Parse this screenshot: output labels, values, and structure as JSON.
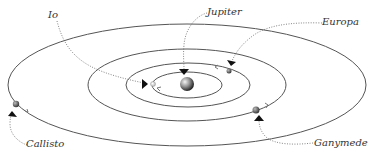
{
  "diagram": {
    "center": {
      "name": "Jupiter",
      "x": 187,
      "y": 84,
      "r": 7
    },
    "orbits": [
      {
        "moon": "Io",
        "rx": 35,
        "ry": 13
      },
      {
        "moon": "Europa",
        "rx": 62,
        "ry": 22
      },
      {
        "moon": "Ganymede",
        "rx": 99,
        "ry": 36
      },
      {
        "moon": "Callisto",
        "rx": 179,
        "ry": 61
      }
    ],
    "labels": {
      "io": "Io",
      "jupiter": "Jupiter",
      "europa": "Europa",
      "callisto": "Callisto",
      "ganymede": "Ganymede"
    },
    "colors": {
      "orbit": "#555555",
      "leader": "#666666",
      "arrow": "#111111",
      "text": "#333333"
    }
  }
}
